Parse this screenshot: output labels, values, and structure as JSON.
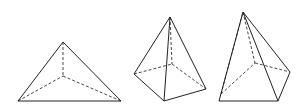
{
  "figure": {
    "shapes": [
      {
        "name": "triangular-pyramid",
        "solid": [
          [
            [
              18,
              101
            ],
            [
              63,
              42
            ]
          ],
          [
            [
              63,
              42
            ],
            [
              121,
              101
            ]
          ],
          [
            [
              18,
              101
            ],
            [
              121,
              101
            ]
          ]
        ],
        "dashed": [
          [
            [
              63,
              42
            ],
            [
              63,
              76
            ]
          ],
          [
            [
              18,
              101
            ],
            [
              63,
              76
            ]
          ],
          [
            [
              63,
              76
            ],
            [
              121,
              101
            ]
          ]
        ]
      },
      {
        "name": "quadrilateral-pyramid-1",
        "solid": [
          [
            [
              134,
              74
            ],
            [
              170,
              17
            ]
          ],
          [
            [
              170,
              17
            ],
            [
              164,
              101
            ]
          ],
          [
            [
              170,
              17
            ],
            [
              206,
              89
            ]
          ],
          [
            [
              134,
              74
            ],
            [
              164,
              101
            ]
          ],
          [
            [
              164,
              101
            ],
            [
              206,
              89
            ]
          ]
        ],
        "dashed": [
          [
            [
              170,
              17
            ],
            [
              172,
              64
            ]
          ],
          [
            [
              134,
              74
            ],
            [
              172,
              64
            ]
          ],
          [
            [
              172,
              64
            ],
            [
              206,
              89
            ]
          ]
        ]
      },
      {
        "name": "quadrilateral-pyramid-2",
        "solid": [
          [
            [
              219,
              101
            ],
            [
              243,
              12
            ]
          ],
          [
            [
              243,
              12
            ],
            [
              278,
              101
            ]
          ],
          [
            [
              243,
              12
            ],
            [
              290,
              72
            ]
          ],
          [
            [
              219,
              101
            ],
            [
              278,
              101
            ]
          ],
          [
            [
              278,
              101
            ],
            [
              290,
              72
            ]
          ]
        ],
        "dashed": [
          [
            [
              243,
              12
            ],
            [
              255,
              63
            ]
          ],
          [
            [
              221,
              94
            ],
            [
              243,
              12
            ]
          ],
          [
            [
              221,
              94
            ],
            [
              255,
              63
            ]
          ],
          [
            [
              255,
              63
            ],
            [
              290,
              72
            ]
          ]
        ]
      }
    ]
  }
}
